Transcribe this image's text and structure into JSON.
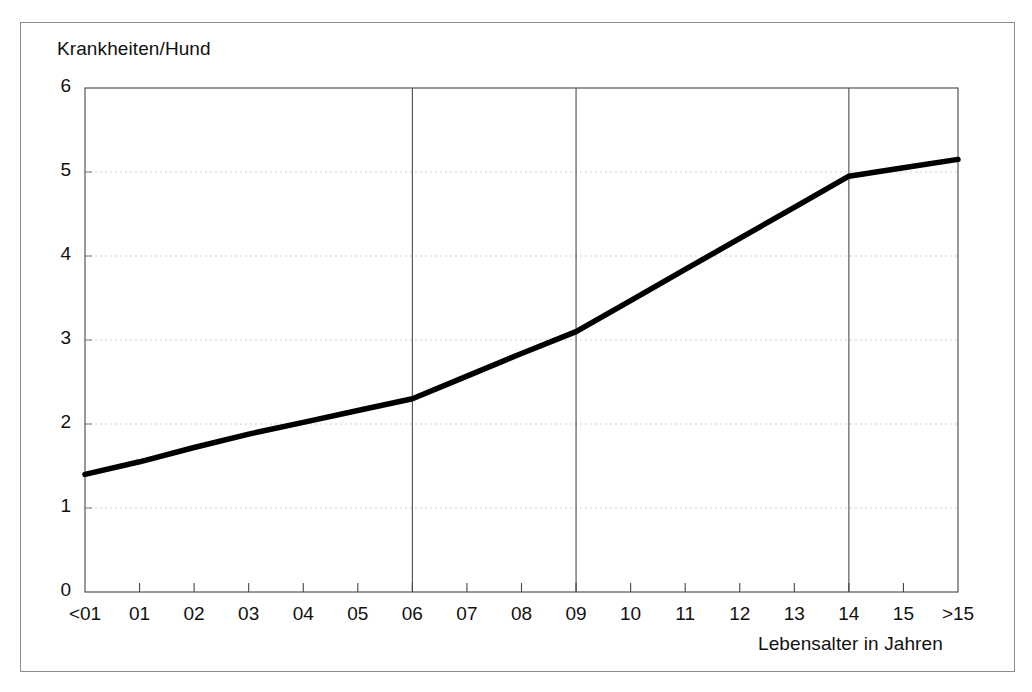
{
  "figure": {
    "background": "#ffffff",
    "border_color": "#8d8d8d",
    "line_color": "#000000",
    "gridline_color": "#cfcfcf",
    "separator_color": "#4a4a4a"
  },
  "chart_data": {
    "type": "line",
    "title": "",
    "xlabel": "Lebensalter in Jahren",
    "ylabel": "Krankheiten/Hund",
    "categories": [
      "<01",
      "01",
      "02",
      "03",
      "04",
      "05",
      "06",
      "07",
      "08",
      "09",
      "10",
      "11",
      "12",
      "13",
      "14",
      "15",
      ">15"
    ],
    "values": [
      1.4,
      1.55,
      1.72,
      1.88,
      2.02,
      2.16,
      2.3,
      2.57,
      2.84,
      3.1,
      3.47,
      3.84,
      4.21,
      4.58,
      4.95,
      5.05,
      5.15
    ],
    "ylim": [
      0,
      6
    ],
    "yticks": [
      0,
      1,
      2,
      3,
      4,
      5,
      6
    ],
    "ytick_labels": [
      "0",
      "1",
      "2",
      "3",
      "4",
      "5",
      "6"
    ],
    "grid": {
      "horizontal": true,
      "vertical_separators": true
    },
    "separator_categories": [
      "06",
      "09",
      "14"
    ],
    "legend": null,
    "annotations": []
  }
}
